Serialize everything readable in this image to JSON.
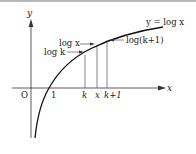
{
  "diagram": {
    "axes": {
      "x_label": "x",
      "y_label": "y",
      "origin_label": "O",
      "tick_one": "1"
    },
    "curve_label": "y = log x",
    "ticks": {
      "k": "k",
      "x": "x",
      "k1": "k+1"
    },
    "annotations": {
      "logx": "log x",
      "logk": "log k",
      "logk1": "log(k+1)"
    },
    "colors": {
      "curve": "#111111",
      "axis": "#333333",
      "guide": "#555555",
      "border": "#b8b8b8"
    }
  }
}
